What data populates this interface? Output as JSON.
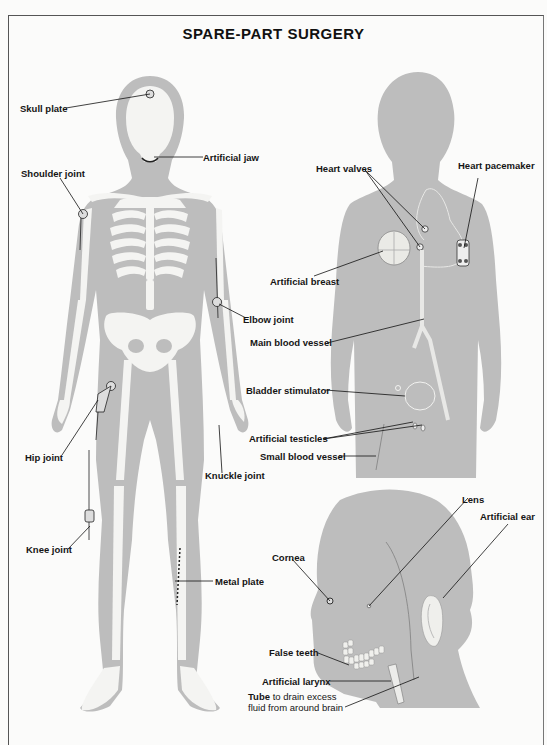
{
  "title": "SPARE-PART SURGERY",
  "colors": {
    "background": "#fbfbfa",
    "silhouette": "#bdbdbd",
    "bone": "#f4f4f2",
    "ink": "#151515"
  },
  "figures": {
    "full_body": {
      "labels": {
        "skull_plate": "Skull plate",
        "artificial_jaw": "Artificial jaw",
        "shoulder_joint": "Shoulder joint",
        "elbow_joint": "Elbow joint",
        "hip_joint": "Hip joint",
        "knuckle_joint": "Knuckle joint",
        "knee_joint": "Knee joint",
        "metal_plate": "Metal plate"
      }
    },
    "torso": {
      "labels": {
        "heart_valves": "Heart valves",
        "heart_pacemaker": "Heart pacemaker",
        "artificial_breast": "Artificial breast",
        "main_blood_vessel": "Main blood vessel",
        "bladder_stimulator": "Bladder stimulator",
        "artificial_testicles": "Artificial testicles",
        "small_blood_vessel": "Small blood vessel"
      }
    },
    "head": {
      "labels": {
        "lens": "Lens",
        "artificial_ear": "Artificial ear",
        "cornea": "Cornea",
        "false_teeth": "False teeth",
        "artificial_larynx": "Artificial larynx",
        "tube_bold": "Tube",
        "tube_line1_rest": " to drain excess",
        "tube_line2": "fluid from around brain"
      }
    }
  }
}
